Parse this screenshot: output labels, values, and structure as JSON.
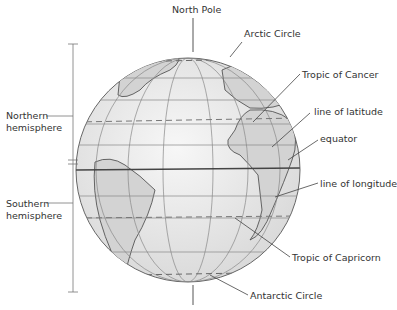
{
  "labels": {
    "north_pole": "North Pole",
    "arctic_circle": "Arctic Circle",
    "tropic_of_cancer": "Tropic of Cancer",
    "line_of_latitude": "line of latitude",
    "equator": "equator",
    "line_of_longitude": "line of longitude",
    "tropic_of_capricorn": "Tropic of Capricorn",
    "antarctic_circle": "Antarctic Circle",
    "northern_hemisphere_1": "Northern",
    "northern_hemisphere_2": "hemisphere",
    "southern_hemisphere_1": "Southern",
    "southern_hemisphere_2": "hemisphere"
  },
  "colors": {
    "globe_fill": "#efefef",
    "land_fill": "#d6d6d6",
    "line": "#555555",
    "text": "#333333"
  }
}
